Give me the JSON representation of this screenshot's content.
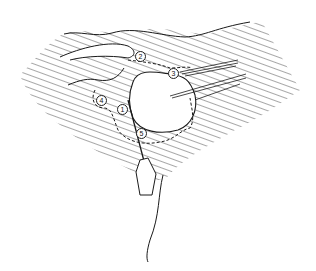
{
  "figure": {
    "type": "line-drawing",
    "colors": {
      "line": "#1a1a1a",
      "background": "#ffffff"
    }
  },
  "labels": [
    {
      "id": "1",
      "text": "1",
      "x": 121,
      "y": 108
    },
    {
      "id": "2",
      "text": "2",
      "x": 139,
      "y": 55
    },
    {
      "id": "3",
      "text": "3",
      "x": 172,
      "y": 72
    },
    {
      "id": "4",
      "text": "4",
      "x": 100,
      "y": 99
    },
    {
      "id": "5",
      "text": "5",
      "x": 140,
      "y": 132
    }
  ]
}
